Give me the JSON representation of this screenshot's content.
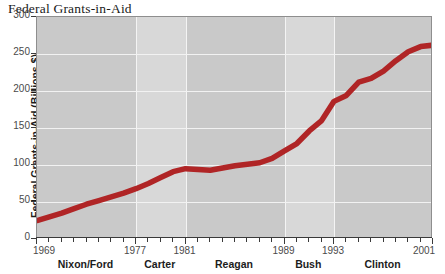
{
  "chart_data": {
    "type": "line",
    "title": "Federal Grants-in-Aid",
    "xlabel": "",
    "ylabel": "Federal Grants-in-Aid (Billions $)",
    "ylim": [
      0,
      300
    ],
    "xlim": [
      1969,
      2001
    ],
    "grid": true,
    "legend": "none",
    "line_color": "#b02526",
    "y_ticks": [
      300,
      250,
      200,
      150,
      100,
      50,
      0
    ],
    "y_tick_labels": [
      "300",
      "250",
      "200",
      "150",
      "100",
      "50",
      "0"
    ],
    "x_tick_years": [
      1969,
      1970,
      1971,
      1972,
      1973,
      1974,
      1975,
      1976,
      1977,
      1978,
      1979,
      1980,
      1981,
      1982,
      1983,
      1984,
      1985,
      1986,
      1987,
      1988,
      1989,
      1990,
      1991,
      1992,
      1993,
      1994,
      1995,
      1996,
      1997,
      1998,
      1999,
      2000,
      2001
    ],
    "x_labeled_years": [
      {
        "year": 1969,
        "label": "1969"
      },
      {
        "year": 1977,
        "label": "1977"
      },
      {
        "year": 1981,
        "label": "1981"
      },
      {
        "year": 1989,
        "label": "1989"
      },
      {
        "year": 1993,
        "label": "1993"
      },
      {
        "year": 2001,
        "label": "2001"
      }
    ],
    "administrations": [
      {
        "name": "Nixon/Ford",
        "start": 1969,
        "end": 1977,
        "shade": "dark"
      },
      {
        "name": "Carter",
        "start": 1977,
        "end": 1981,
        "shade": "light"
      },
      {
        "name": "Reagan",
        "start": 1981,
        "end": 1989,
        "shade": "dark"
      },
      {
        "name": "Bush",
        "start": 1989,
        "end": 1993,
        "shade": "light"
      },
      {
        "name": "Clinton",
        "start": 1993,
        "end": 2001,
        "shade": "dark"
      }
    ],
    "x": [
      1969,
      1970,
      1971,
      1972,
      1973,
      1974,
      1975,
      1976,
      1977,
      1978,
      1979,
      1980,
      1981,
      1982,
      1983,
      1984,
      1985,
      1986,
      1987,
      1988,
      1989,
      1990,
      1991,
      1992,
      1993,
      1994,
      1995,
      1996,
      1997,
      1998,
      1999,
      2000,
      2001
    ],
    "values": [
      25,
      30,
      35,
      41,
      47,
      52,
      57,
      62,
      68,
      75,
      83,
      91,
      95,
      94,
      93,
      96,
      99,
      101,
      103,
      109,
      119,
      129,
      146,
      160,
      186,
      194,
      212,
      217,
      227,
      241,
      253,
      260,
      262
    ],
    "series": [
      {
        "name": "Federal Grants-in-Aid",
        "values": [
          25,
          30,
          35,
          41,
          47,
          52,
          57,
          62,
          68,
          75,
          83,
          91,
          95,
          94,
          93,
          96,
          99,
          101,
          103,
          109,
          119,
          129,
          146,
          160,
          186,
          194,
          212,
          217,
          227,
          241,
          253,
          260,
          262
        ]
      }
    ]
  }
}
